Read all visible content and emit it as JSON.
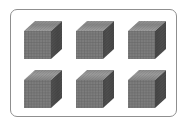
{
  "figure": {
    "count": 6,
    "rows": 2,
    "cols": 3,
    "item": "thousand-cube",
    "colors": {
      "front": "#7a7a7a",
      "top": "#9a9a9a",
      "side": "#505050",
      "grid_line": "#5a5a5a",
      "border": "#8f8f8f"
    },
    "cubes": [
      {
        "row": 0,
        "col": 0,
        "x": 24,
        "y": 31
      },
      {
        "row": 0,
        "col": 1,
        "x": 76,
        "y": 31
      },
      {
        "row": 0,
        "col": 2,
        "x": 128,
        "y": 31
      },
      {
        "row": 1,
        "col": 0,
        "x": 24,
        "y": 80
      },
      {
        "row": 1,
        "col": 1,
        "x": 76,
        "y": 80
      },
      {
        "row": 1,
        "col": 2,
        "x": 128,
        "y": 80
      }
    ]
  }
}
